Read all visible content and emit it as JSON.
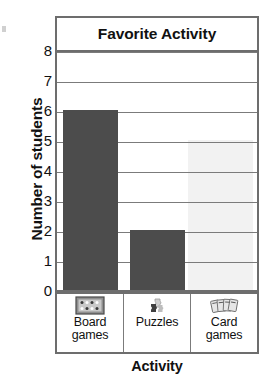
{
  "chart_data": {
    "type": "bar",
    "title": "Favorite Activity",
    "xlabel": "Activity",
    "ylabel": "Number of students",
    "categories": [
      "Board games",
      "Puzzles",
      "Card games"
    ],
    "values": [
      6,
      2,
      0
    ],
    "ylim": [
      0,
      8
    ],
    "ytick_labels": [
      "8",
      "7",
      "6",
      "5",
      "4",
      "3",
      "2",
      "1",
      "0"
    ],
    "ytick_values": [
      8,
      7,
      6,
      5,
      4,
      3,
      2,
      1,
      0
    ],
    "grid": true,
    "legend": "none",
    "bar_color": "#4c4c4c",
    "frame_color": "#6d6d6d",
    "gridline_color": "#7b7b7b",
    "background_color": "#ffffff"
  },
  "categories": [
    {
      "label": "Board\ngames",
      "value": 6,
      "icon": "board-game-icon"
    },
    {
      "label": "Puzzles",
      "value": 2,
      "icon": "puzzle-piece-icon"
    },
    {
      "label": "Card\ngames",
      "value": 0,
      "icon": "playing-cards-icon"
    }
  ]
}
